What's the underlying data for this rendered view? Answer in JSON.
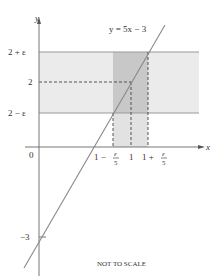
{
  "diagram": {
    "type": "epsilon-delta illustration",
    "line_label": "y = 5x − 3",
    "axes": {
      "x_label": "x",
      "y_label": "y"
    },
    "y_ticks": [
      {
        "label": "2 + ε"
      },
      {
        "label": "2"
      },
      {
        "label": "2 − ε"
      },
      {
        "label": "0"
      },
      {
        "label": "−3"
      }
    ],
    "x_ticks": [
      {
        "main": "1 −",
        "frac_num": "ε",
        "frac_den": "5"
      },
      {
        "main": "1"
      },
      {
        "main": "1 +",
        "frac_num": "ε",
        "frac_den": "5"
      }
    ],
    "note": "NOT TO SCALE",
    "colors": {
      "band_light": "#ebebeb",
      "band_dark": "#c8c8c8",
      "band_edge": "#999999",
      "axis": "#777777",
      "line": "#888888",
      "dash": "#444444"
    }
  }
}
